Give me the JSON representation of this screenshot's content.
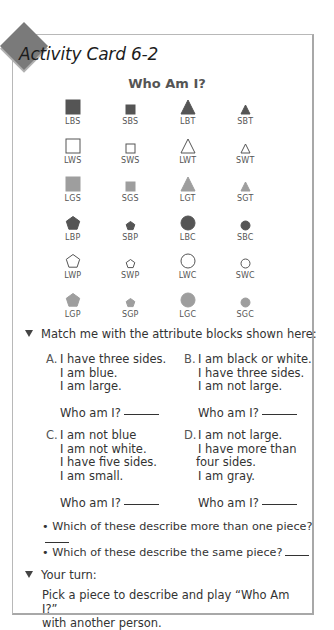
{
  "card": {
    "title": "Activity Card 6-2",
    "heading": "Who Am I?",
    "badge_color": "#7a7a7a"
  },
  "colors": {
    "black": "#555555",
    "gray": "#9e9e9e",
    "white": "#ffffff",
    "outline": "#555555"
  },
  "blocks": [
    [
      {
        "code": "LBS",
        "size": "L",
        "color": "black",
        "shape": "square"
      },
      {
        "code": "SBS",
        "size": "S",
        "color": "black",
        "shape": "square"
      },
      {
        "code": "LBT",
        "size": "L",
        "color": "black",
        "shape": "triangle"
      },
      {
        "code": "SBT",
        "size": "S",
        "color": "black",
        "shape": "triangle"
      }
    ],
    [
      {
        "code": "LWS",
        "size": "L",
        "color": "white",
        "shape": "square"
      },
      {
        "code": "SWS",
        "size": "S",
        "color": "white",
        "shape": "square"
      },
      {
        "code": "LWT",
        "size": "L",
        "color": "white",
        "shape": "triangle"
      },
      {
        "code": "SWT",
        "size": "S",
        "color": "white",
        "shape": "triangle"
      }
    ],
    [
      {
        "code": "LGS",
        "size": "L",
        "color": "gray",
        "shape": "square"
      },
      {
        "code": "SGS",
        "size": "S",
        "color": "gray",
        "shape": "square"
      },
      {
        "code": "LGT",
        "size": "L",
        "color": "gray",
        "shape": "triangle"
      },
      {
        "code": "SGT",
        "size": "S",
        "color": "gray",
        "shape": "triangle"
      }
    ],
    [
      {
        "code": "LBP",
        "size": "L",
        "color": "black",
        "shape": "pentagon"
      },
      {
        "code": "SBP",
        "size": "S",
        "color": "black",
        "shape": "pentagon"
      },
      {
        "code": "LBC",
        "size": "L",
        "color": "black",
        "shape": "circle"
      },
      {
        "code": "SBC",
        "size": "S",
        "color": "black",
        "shape": "circle"
      }
    ],
    [
      {
        "code": "LWP",
        "size": "L",
        "color": "white",
        "shape": "pentagon"
      },
      {
        "code": "SWP",
        "size": "S",
        "color": "white",
        "shape": "pentagon"
      },
      {
        "code": "LWC",
        "size": "L",
        "color": "white",
        "shape": "circle"
      },
      {
        "code": "SWC",
        "size": "S",
        "color": "white",
        "shape": "circle"
      }
    ],
    [
      {
        "code": "LGP",
        "size": "L",
        "color": "gray",
        "shape": "pentagon"
      },
      {
        "code": "SGP",
        "size": "S",
        "color": "gray",
        "shape": "pentagon"
      },
      {
        "code": "LGC",
        "size": "L",
        "color": "gray",
        "shape": "circle"
      },
      {
        "code": "SGC",
        "size": "S",
        "color": "gray",
        "shape": "circle"
      }
    ]
  ],
  "match": {
    "instruction": "Match me with the attribute blocks shown here:",
    "questions": [
      {
        "letter": "A.",
        "lines": [
          "I have three sides.",
          "I am blue.",
          "I am large."
        ],
        "prompt": "Who am I?"
      },
      {
        "letter": "B.",
        "lines": [
          "I am black or white.",
          "I have three sides.",
          "I am not large."
        ],
        "prompt": "Who am I?"
      },
      {
        "letter": "C.",
        "lines": [
          "I am not blue",
          "I am not white.",
          "I have five sides.",
          "I am small."
        ],
        "prompt": "Who am I?"
      },
      {
        "letter": "D.",
        "lines": [
          "I am not large.",
          "I have more than",
          "four sides.",
          "I am gray."
        ],
        "prompt": "Who am I?"
      }
    ],
    "bullets": [
      "Which of these describe more than one piece?",
      "Which of these describe the same piece?"
    ]
  },
  "your_turn": {
    "label": "Your turn:",
    "text_line1": "Pick a piece to describe and play “Who Am I?”",
    "text_line2": "with another person."
  }
}
